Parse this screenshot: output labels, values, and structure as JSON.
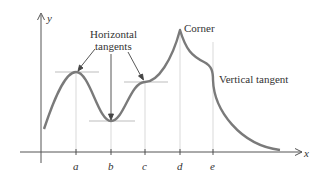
{
  "axes": {
    "x_label": "x",
    "y_label": "y"
  },
  "ticks": [
    "a",
    "b",
    "c",
    "d",
    "e"
  ],
  "annotations": {
    "horizontal_line1": "Horizontal",
    "horizontal_line2": "tangents",
    "corner": "Corner",
    "vertical": "Vertical tangent"
  },
  "colors": {
    "curve": "#7a7a7a",
    "axis": "#555555",
    "guide": "#c8c8c8"
  }
}
